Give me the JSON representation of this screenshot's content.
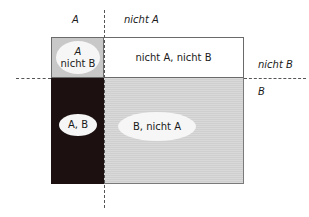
{
  "labels": {
    "col_a": "A",
    "col_not_a": "nicht A",
    "row_not_b": "nicht B",
    "row_b": "B"
  },
  "cells": {
    "a_not_b": {
      "line1": "A",
      "line2": "nicht B"
    },
    "not_a_not_b": "nicht A, nicht B",
    "a_b": "A, B",
    "b_not_a": "B, nicht A"
  },
  "colors": {
    "a_not_b_fill": "#c8c8c8",
    "not_a_not_b_fill": "#ffffff",
    "a_b_fill": "#1c1010",
    "b_not_a_fill": "#d4d4d4",
    "ellipse_fill": "#f6f6f6"
  }
}
